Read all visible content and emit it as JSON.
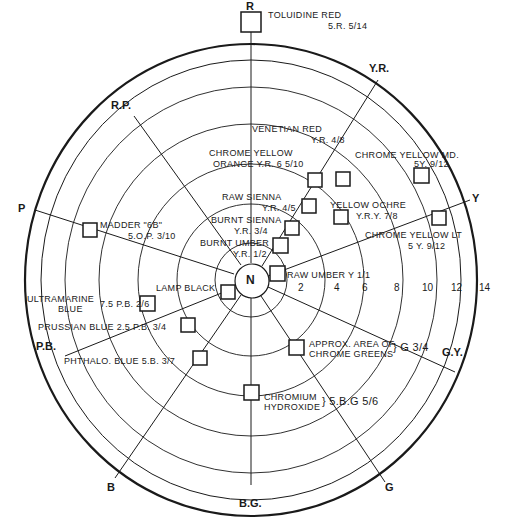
{
  "diagram": {
    "type": "munsell-hue-chroma-wheel",
    "center_label": "N",
    "hues": [
      {
        "id": "R",
        "label": "R"
      },
      {
        "id": "YR",
        "label": "Y.R."
      },
      {
        "id": "Y",
        "label": "Y"
      },
      {
        "id": "GY",
        "label": "G.Y."
      },
      {
        "id": "G",
        "label": "G"
      },
      {
        "id": "BG",
        "label": "B.G."
      },
      {
        "id": "B",
        "label": "B"
      },
      {
        "id": "PB",
        "label": "P.B."
      },
      {
        "id": "P",
        "label": "P"
      },
      {
        "id": "RP",
        "label": "R.P."
      }
    ],
    "chroma_ticks": [
      "2",
      "4",
      "6",
      "8",
      "10",
      "12",
      "14"
    ],
    "pigments": [
      {
        "name": "TOLUIDINE RED",
        "notation": "5.R. 5/14"
      },
      {
        "name": "VENETIAN RED",
        "notation": "Y.R. 4/8"
      },
      {
        "name": "CHROME YELLOW MD.",
        "notation": "5 Y. 9/12"
      },
      {
        "name": "CHROME YELLOW ORANGE",
        "notation": "Y.R. 6 5/10"
      },
      {
        "name": "RAW SIENNA",
        "notation": "Y.R. 4/5"
      },
      {
        "name": "YELLOW OCHRE",
        "notation": "Y.R.Y. 7/8"
      },
      {
        "name": "BURNT SIENNA",
        "notation": "Y.R. 3/4"
      },
      {
        "name": "CHROME YELLOW LT",
        "notation": "5 Y. 9/12"
      },
      {
        "name": "BURNT UMBER",
        "notation": "Y.R. 1/2"
      },
      {
        "name": "RAW UMBER",
        "notation": "Y 1/1"
      },
      {
        "name": "MADDER \"6B\"",
        "notation": "5.O.P. 3/10"
      },
      {
        "name": "LAMP BLACK",
        "notation": ""
      },
      {
        "name": "ULTRAMARINE BLUE",
        "notation": "7.5 P.B. 2/6"
      },
      {
        "name": "PRUSSIAN BLUE",
        "notation": "2.5 P.B. 3/4"
      },
      {
        "name": "PHTHALO. BLUE",
        "notation": "5.B. 3/7"
      },
      {
        "name": "APPROX. AREA OF CHROME GREENS",
        "notation": "G 3/4"
      },
      {
        "name": "CHROMIUM HYDROXIDE",
        "notation": "5.B.G 5/6"
      }
    ]
  },
  "labels": {
    "toluidine_1": "TOLUIDINE RED",
    "toluidine_2": "5.R. 5/14",
    "venetian_1": "VENETIAN RED",
    "venetian_2": "Y.R. 4/8",
    "cymd_1": "CHROME YELLOW MD.",
    "cymd_2": "5Y. 9/12",
    "cyo_1": "CHROME YELLOW",
    "cyo_2": "ORANGE  Y.R. 6 5/10",
    "rawsienna_1": "RAW SIENNA",
    "rawsienna_2": "Y.R. 4/5",
    "ochre_1": "YELLOW OCHRE",
    "ochre_2": "Y.R.Y. 7/8",
    "burntsienna_1": "BURNT SIENNA",
    "burntsienna_2": "Y.R. 3/4",
    "cylt_1": "CHROME YELLOW LT",
    "cylt_2": "5 Y. 9/12",
    "burntumber_1": "BURNT UMBER",
    "burntumber_2": "Y.R. 1/2",
    "rawumber": "RAW UMBER Y 1/1",
    "madder_1": "MADDER \"6B\"",
    "madder_2": "5.O.P. 3/10",
    "lampblack": "LAMP BLACK",
    "ultramarine_1": "ULTRAMARINE",
    "ultramarine_2": "BLUE",
    "ultramarine_3": "7.5 P.B. 2/6",
    "prussian": "PRUSSIAN  BLUE  2.5 P.B. 3/4",
    "phthalo": "PHTHALO. BLUE  5.B. 3/7",
    "greens_1": "APPROX. AREA OF",
    "greens_2": "CHROME GREENS",
    "greens_3": "} G 3/4",
    "chromium_1": "CHROMIUM",
    "chromium_2": "HYDROXIDE",
    "chromium_3": "} 5.B.G 5/6"
  }
}
